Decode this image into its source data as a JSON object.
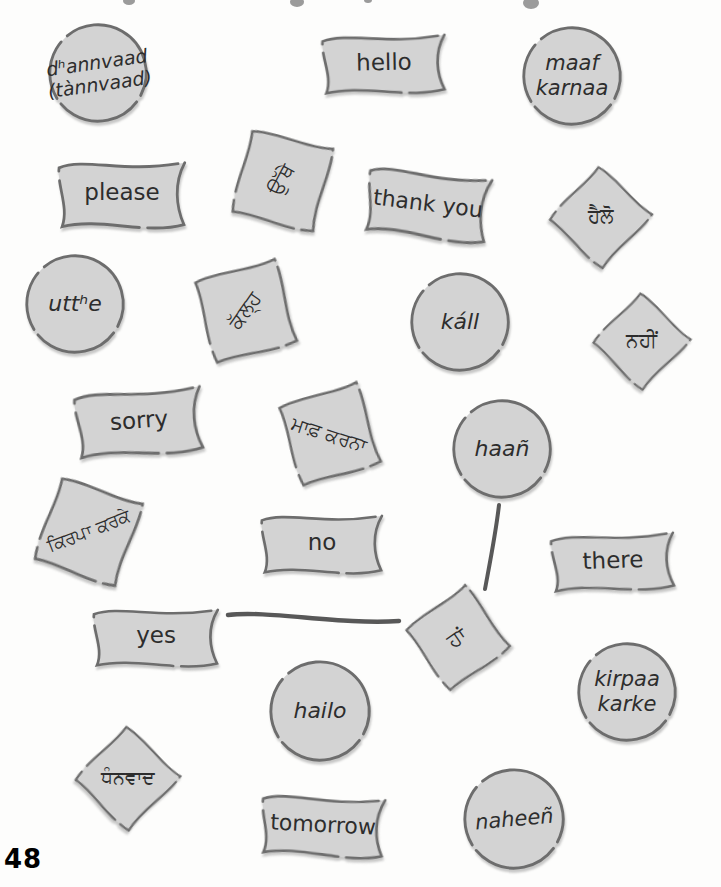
{
  "page": {
    "number": "48"
  },
  "colors": {
    "page_bg": "#fdfdfc",
    "card_fill": "#d3d3d3",
    "card_stroke": "#6d6d6d",
    "text": "#2d2d2d",
    "line": "#585858",
    "fragment": "#9b9b9b"
  },
  "cards": [
    {
      "id": "dhannvaad-roman",
      "shape": "circle",
      "label": "dʰannvaad\n(tànnvaad)",
      "script": "roman",
      "italic": true,
      "cx": 98,
      "cy": 73,
      "w": 104,
      "h": 104,
      "rot": 0,
      "trot": -8,
      "fs": 19
    },
    {
      "id": "hello-english",
      "shape": "flag",
      "label": "hello",
      "script": "english",
      "italic": false,
      "cx": 384,
      "cy": 63,
      "w": 130,
      "h": 66,
      "rot": -1,
      "trot": -1,
      "fs": 23
    },
    {
      "id": "maaf-karnaa-roman",
      "shape": "circle",
      "label": "maaf\nkarnaa",
      "script": "roman",
      "italic": true,
      "cx": 572,
      "cy": 76,
      "w": 104,
      "h": 104,
      "rot": 0,
      "trot": 0,
      "fs": 21
    },
    {
      "id": "please-english",
      "shape": "flag",
      "label": "please",
      "script": "english",
      "italic": false,
      "cx": 122,
      "cy": 193,
      "w": 134,
      "h": 75,
      "rot": 0,
      "trot": 0,
      "fs": 23
    },
    {
      "id": "utthe-gurmukhi",
      "shape": "square",
      "label": "ਉੱਥੇ",
      "script": "gurmukhi",
      "italic": false,
      "cx": 282,
      "cy": 180,
      "w": 96,
      "h": 96,
      "rot": 15,
      "trot": -62,
      "fs": 20
    },
    {
      "id": "thank-you-english",
      "shape": "flag",
      "label": "thank you",
      "script": "english",
      "italic": false,
      "cx": 428,
      "cy": 203,
      "w": 130,
      "h": 75,
      "rot": 7,
      "trot": 7,
      "fs": 22
    },
    {
      "id": "hailo-gurmukhi",
      "shape": "square",
      "label": "ਹੈਲੋ",
      "script": "gurmukhi",
      "italic": false,
      "cx": 600,
      "cy": 216,
      "w": 83,
      "h": 83,
      "rot": 44,
      "trot": 0,
      "fs": 20
    },
    {
      "id": "utthe-roman",
      "shape": "circle",
      "label": "uttʰe",
      "script": "roman",
      "italic": true,
      "cx": 75,
      "cy": 304,
      "w": 104,
      "h": 104,
      "rot": 0,
      "trot": 0,
      "fs": 22
    },
    {
      "id": "kall-gurmukhi",
      "shape": "square",
      "label": "ਕੱਲ੍ਹ",
      "script": "gurmukhi",
      "italic": false,
      "cx": 245,
      "cy": 311,
      "w": 96,
      "h": 96,
      "rot": -14,
      "trot": -55,
      "fs": 20
    },
    {
      "id": "kall-roman",
      "shape": "circle",
      "label": "káll",
      "script": "roman",
      "italic": true,
      "cx": 460,
      "cy": 322,
      "w": 104,
      "h": 104,
      "rot": 0,
      "trot": 0,
      "fs": 22
    },
    {
      "id": "naheen-gurmukhi",
      "shape": "square",
      "label": "ਨਹੀਂ",
      "script": "gurmukhi",
      "italic": false,
      "cx": 641,
      "cy": 340,
      "w": 79,
      "h": 79,
      "rot": 45,
      "trot": 0,
      "fs": 20
    },
    {
      "id": "sorry-english",
      "shape": "flag",
      "label": "sorry",
      "script": "english",
      "italic": false,
      "cx": 139,
      "cy": 421,
      "w": 134,
      "h": 74,
      "rot": -4,
      "trot": -4,
      "fs": 23
    },
    {
      "id": "maaf-karnaa-gurmukhi",
      "shape": "square",
      "label": "ਮਾਫ਼ ਕਰਨਾ",
      "script": "gurmukhi",
      "italic": false,
      "cx": 329,
      "cy": 434,
      "w": 94,
      "h": 94,
      "rot": -16,
      "trot": 18,
      "fs": 19
    },
    {
      "id": "haan-roman",
      "shape": "circle",
      "label": "haañ",
      "script": "roman",
      "italic": true,
      "cx": 502,
      "cy": 449,
      "w": 104,
      "h": 104,
      "rot": 0,
      "trot": 0,
      "fs": 22
    },
    {
      "id": "kirpaa-karke-gurmukhi",
      "shape": "square",
      "label": "ਕਿਰਪਾ ਕਰਕੇ",
      "script": "gurmukhi",
      "italic": false,
      "cx": 88,
      "cy": 531,
      "w": 98,
      "h": 98,
      "rot": 20,
      "trot": -21,
      "fs": 18
    },
    {
      "id": "no-english",
      "shape": "flag",
      "label": "no",
      "script": "english",
      "italic": false,
      "cx": 322,
      "cy": 543,
      "w": 128,
      "h": 66,
      "rot": 0,
      "trot": 0,
      "fs": 23
    },
    {
      "id": "there-english",
      "shape": "flag",
      "label": "there",
      "script": "english",
      "italic": false,
      "cx": 613,
      "cy": 561,
      "w": 130,
      "h": 64,
      "rot": -2,
      "trot": -2,
      "fs": 23
    },
    {
      "id": "yes-english",
      "shape": "flag",
      "label": "yes",
      "script": "english",
      "italic": false,
      "cx": 156,
      "cy": 636,
      "w": 132,
      "h": 65,
      "rot": 0,
      "trot": 0,
      "fs": 23
    },
    {
      "id": "haan-gurmukhi",
      "shape": "square",
      "label": "ਹਾਂ",
      "script": "gurmukhi",
      "italic": false,
      "cx": 457,
      "cy": 638,
      "w": 86,
      "h": 86,
      "rot": -35,
      "trot": -35,
      "fs": 21
    },
    {
      "id": "kirpaa-karke-roman",
      "shape": "circle",
      "label": "kirpaa\nkarke",
      "script": "roman",
      "italic": true,
      "cx": 627,
      "cy": 692,
      "w": 104,
      "h": 104,
      "rot": 0,
      "trot": 0,
      "fs": 21
    },
    {
      "id": "hailo-roman",
      "shape": "circle",
      "label": "hailo",
      "script": "roman",
      "italic": true,
      "cx": 320,
      "cy": 711,
      "w": 106,
      "h": 106,
      "rot": 0,
      "trot": 0,
      "fs": 22
    },
    {
      "id": "dhannvaad-gurmukhi",
      "shape": "square",
      "label": "ਧੰਨਵਾਦ",
      "script": "gurmukhi",
      "italic": false,
      "cx": 127,
      "cy": 777,
      "w": 85,
      "h": 85,
      "rot": 45,
      "trot": 0,
      "fs": 19
    },
    {
      "id": "tomorrow-english",
      "shape": "flag",
      "label": "tomorrow",
      "script": "english",
      "italic": false,
      "cx": 323,
      "cy": 825,
      "w": 130,
      "h": 68,
      "rot": 3,
      "trot": 3,
      "fs": 22
    },
    {
      "id": "naheen-roman",
      "shape": "circle",
      "label": "naheeñ",
      "script": "roman",
      "italic": true,
      "cx": 514,
      "cy": 819,
      "w": 106,
      "h": 106,
      "rot": 0,
      "trot": -5,
      "fs": 21
    }
  ],
  "connections": [
    {
      "id": "yes-to-haan",
      "from": "yes",
      "to": "ਹਾਂ",
      "path": "M 228 615 C 268 610 340 625 399 621",
      "width": 4.4
    },
    {
      "id": "haan-circle-to-haan-diamond",
      "from": "haañ",
      "to": "ਹਾਂ",
      "path": "M 499 505 C 496 532 490 562 485 589",
      "width": 4
    }
  ],
  "top_fragments": [
    {
      "cx": 129,
      "cy": 1,
      "rx": 6,
      "ry": 4
    },
    {
      "cx": 297,
      "cy": 2,
      "rx": 7,
      "ry": 5
    },
    {
      "cx": 368,
      "cy": 0,
      "rx": 4,
      "ry": 3
    },
    {
      "cx": 531,
      "cy": 3,
      "rx": 8,
      "ry": 6
    }
  ]
}
